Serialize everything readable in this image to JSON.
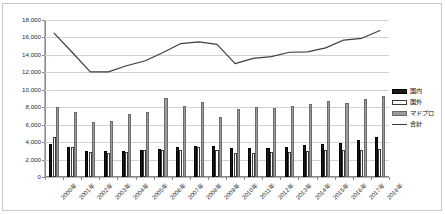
{
  "chart_data": {
    "type": "bar",
    "title": "",
    "subtitle": "",
    "xlabel": "",
    "ylabel": "",
    "ylim": [
      0,
      18000
    ],
    "ytick_labels": [
      "0",
      "2,000",
      "4,000",
      "6,000",
      "8,000",
      "10,000",
      "12,000",
      "14,000",
      "16,000",
      "18,000"
    ],
    "ytick_values": [
      0,
      2000,
      4000,
      6000,
      8000,
      10000,
      12000,
      14000,
      16000,
      18000
    ],
    "grid": true,
    "legend_position": "right",
    "categories": [
      "2000年",
      "2001年",
      "2002年",
      "2003年",
      "2004年",
      "2005年",
      "2006年",
      "2007年",
      "2008年",
      "2009年",
      "2010年",
      "2011年",
      "2012年",
      "2013年",
      "2014年",
      "2015年",
      "2016年",
      "2017年",
      "2018年"
    ],
    "series": [
      {
        "name": "国内",
        "kind": "bar",
        "color": "#1a1a1a",
        "values": [
          3800,
          3400,
          3000,
          2950,
          3000,
          3050,
          3200,
          3400,
          3600,
          3550,
          3350,
          3300,
          3350,
          3400,
          3700,
          3800,
          3900,
          4200,
          4600
        ]
      },
      {
        "name": "国外",
        "kind": "bar",
        "color": "#ffffff",
        "values": [
          4600,
          3450,
          2850,
          2800,
          2900,
          3150,
          3100,
          3150,
          3400,
          3050,
          2700,
          2700,
          2850,
          2900,
          2950,
          3050,
          3150,
          3050,
          3250
        ]
      },
      {
        "name": "マドプロ",
        "kind": "bar",
        "color": "#9c9c9c",
        "values": [
          8000,
          7450,
          6350,
          6450,
          7250,
          7450,
          9050,
          8100,
          8600,
          6900,
          7800,
          8000,
          7950,
          8150,
          8350,
          8750,
          8500,
          8900,
          9300
        ]
      },
      {
        "name": "合計",
        "kind": "line",
        "color": "#3d3d3d",
        "values": [
          16500,
          14300,
          12050,
          12050,
          12750,
          13300,
          14250,
          15300,
          15500,
          15200,
          13000,
          13600,
          13800,
          14300,
          14350,
          14800,
          15700,
          15900,
          16800
        ]
      }
    ]
  },
  "legend": {
    "items": [
      {
        "label": "国内",
        "swatch": "domestic"
      },
      {
        "label": "国外",
        "swatch": "foreign"
      },
      {
        "label": "マドプロ",
        "swatch": "madpro"
      },
      {
        "label": "合計",
        "swatch": "total"
      }
    ]
  }
}
